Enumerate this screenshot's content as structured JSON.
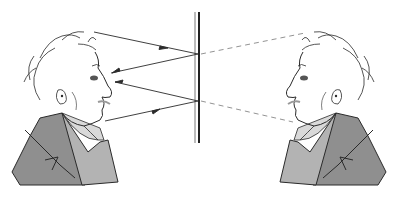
{
  "diagram": {
    "type": "optics-illustration",
    "colors": {
      "background": "#ffffff",
      "line": "#2a2a2a",
      "jacket_dark": "#8f8f8f",
      "jacket_light": "#b3b3b3",
      "shirt": "#a6a6a6",
      "dashed": "#777777"
    },
    "mirror": {
      "x_thin": 195,
      "x_thick": 199,
      "y_top": 12,
      "y_bottom": 143
    },
    "reflection_points": [
      {
        "x": 198,
        "y": 54
      },
      {
        "x": 198,
        "y": 101
      }
    ],
    "rays": [
      {
        "name": "incident-ray-from-head-top",
        "x1": 94,
        "y1": 32,
        "x2": 198,
        "y2": 54,
        "arrow_at": 0.6
      },
      {
        "name": "reflected-ray-to-eye-1",
        "x1": 198,
        "y1": 54,
        "x2": 111,
        "y2": 73,
        "arrow_at": 0.9
      },
      {
        "name": "incident-ray-from-chin",
        "x1": 105,
        "y1": 121,
        "x2": 198,
        "y2": 101,
        "arrow_at": 0.6
      },
      {
        "name": "reflected-ray-to-eye-2",
        "x1": 198,
        "y1": 101,
        "x2": 115,
        "y2": 82,
        "arrow_at": 0.9
      }
    ],
    "virtual_rays": [
      {
        "name": "virtual-ray-to-image-head",
        "x1": 200,
        "y1": 54,
        "x2": 305,
        "y2": 33
      },
      {
        "name": "virtual-ray-to-image-chin",
        "x1": 200,
        "y1": 101,
        "x2": 293,
        "y2": 122
      }
    ],
    "figures": [
      {
        "name": "real-person",
        "facing": "right"
      },
      {
        "name": "mirror-image-person",
        "facing": "left"
      }
    ]
  }
}
